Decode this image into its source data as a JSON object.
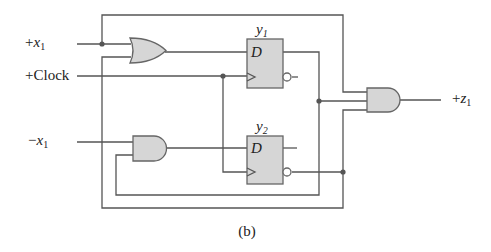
{
  "diagram": {
    "type": "sequential-logic-circuit",
    "caption": "(b)",
    "inputs": [
      {
        "id": "x1_pos",
        "sign": "+",
        "var": "x",
        "sub": "1"
      },
      {
        "id": "clock",
        "label": "+Clock"
      },
      {
        "id": "x1_neg",
        "sign": "−",
        "var": "x",
        "sub": "1"
      }
    ],
    "outputs": [
      {
        "id": "z1",
        "sign": "+",
        "var": "z",
        "sub": "1"
      }
    ],
    "flip_flops": [
      {
        "id": "y1",
        "var": "y",
        "sub": "1",
        "input_label": "D",
        "type": "D"
      },
      {
        "id": "y2",
        "var": "y",
        "sub": "2",
        "input_label": "D",
        "type": "D"
      }
    ],
    "gates": [
      {
        "id": "or1",
        "type": "OR",
        "inputs": [
          "+x1",
          "y2'"
        ],
        "output": "D of y1"
      },
      {
        "id": "and1",
        "type": "AND",
        "inputs": [
          "-x1",
          "y1'"
        ],
        "output": "D of y2"
      },
      {
        "id": "and2",
        "type": "AND",
        "inputs": [
          "+x1",
          "y1",
          "y2'"
        ],
        "output": "+z1"
      }
    ],
    "colors": {
      "gate_fill": "#d6d6d6",
      "wire": "#555555",
      "text": "#222222"
    }
  }
}
